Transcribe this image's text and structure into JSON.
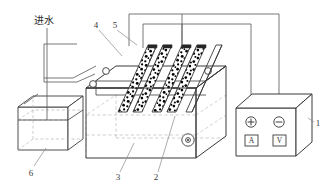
{
  "figure": {
    "title_text_visible": false,
    "background_color": "#ffffff",
    "line_color": "#3a3a3a",
    "dot_color": "#000000",
    "dashed_color": "#9a9a9a"
  },
  "labels": {
    "inlet": "进水",
    "power_supply": "1",
    "partition": "2",
    "reactor_tank": "3",
    "electrode_plate_a": "4",
    "electrode_plate_b": "5",
    "feed_tank": "6"
  },
  "power_supply": {
    "terminal_positive": "+",
    "terminal_negative": "−",
    "ammeter": "A",
    "voltmeter": "V"
  },
  "parts": [
    {
      "ref": "1",
      "name": "power-supply"
    },
    {
      "ref": "2",
      "name": "partition-plate"
    },
    {
      "ref": "3",
      "name": "reactor-tank"
    },
    {
      "ref": "4",
      "name": "electrode-plate-front"
    },
    {
      "ref": "5",
      "name": "electrode-plate-rear"
    },
    {
      "ref": "6",
      "name": "feed-water-tank"
    }
  ]
}
